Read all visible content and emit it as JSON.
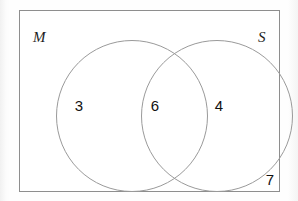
{
  "diagram": {
    "type": "venn",
    "universe": {
      "name": "universal-set-rectangle",
      "outside_count": "7"
    },
    "sets": [
      {
        "id": "M",
        "label": "M",
        "only_count": "3"
      },
      {
        "id": "S",
        "label": "S",
        "only_count": "4"
      }
    ],
    "intersection": {
      "label": "M and S",
      "count": "6"
    },
    "colors": {
      "background": "#ffffff",
      "rect_border": "#8e8e8e",
      "circle_border": "#9a9a9a",
      "text": "#111111"
    }
  }
}
